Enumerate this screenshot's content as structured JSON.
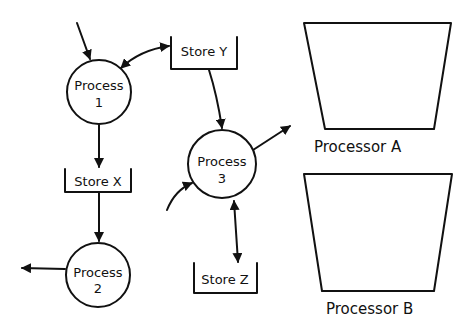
{
  "diagram": {
    "type": "data-flow-diagram",
    "colors": {
      "ink": "#111111",
      "background": "#ffffff"
    },
    "processes": [
      {
        "id": "p1",
        "line1": "Process",
        "line2": "1"
      },
      {
        "id": "p2",
        "line1": "Process",
        "line2": "2"
      },
      {
        "id": "p3",
        "line1": "Process",
        "line2": "3"
      }
    ],
    "stores": [
      {
        "id": "sy",
        "label": "Store Y"
      },
      {
        "id": "sx",
        "label": "Store X"
      },
      {
        "id": "sz",
        "label": "Store Z"
      }
    ],
    "processors": [
      {
        "id": "pa",
        "label": "Processor A"
      },
      {
        "id": "pb",
        "label": "Processor B"
      }
    ],
    "flows": [
      {
        "from": "external",
        "to": "Process 1"
      },
      {
        "from": "Process 1",
        "to": "Store Y",
        "bidirectional": true
      },
      {
        "from": "Process 1",
        "to": "Store X"
      },
      {
        "from": "Store X",
        "to": "Process 2"
      },
      {
        "from": "Process 2",
        "to": "external"
      },
      {
        "from": "Store Y",
        "to": "Process 3"
      },
      {
        "from": "external",
        "to": "Process 3"
      },
      {
        "from": "Process 3",
        "to": "external"
      },
      {
        "from": "Process 3",
        "to": "Store Z",
        "bidirectional": true
      }
    ]
  }
}
